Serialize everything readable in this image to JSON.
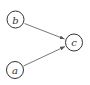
{
  "diagram": {
    "type": "directed-graph",
    "nodes": [
      {
        "id": "b",
        "label": "b"
      },
      {
        "id": "c",
        "label": "c"
      },
      {
        "id": "a",
        "label": "a"
      }
    ],
    "edges": [
      {
        "from": "b",
        "to": "c"
      },
      {
        "from": "a",
        "to": "c"
      }
    ]
  }
}
